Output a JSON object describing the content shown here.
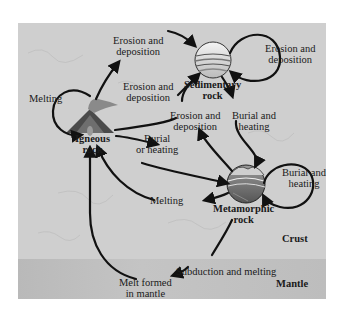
{
  "diagram": {
    "layers": {
      "crust": "Crust",
      "mantle": "Mantle"
    },
    "nodes": {
      "igneous": {
        "line1": "Igneous",
        "line2": "rock"
      },
      "sedimentary": {
        "line1": "Sedimentary",
        "line2": "rock"
      },
      "metamorphic": {
        "line1": "Metamorphic",
        "line2": "rock"
      },
      "mantle_melt": {
        "line1": "Melt formed",
        "line2": "in mantle"
      }
    },
    "processes": {
      "erosion_top": {
        "line1": "Erosion and",
        "line2": "deposition"
      },
      "erosion_sed_loop": {
        "line1": "Erosion and",
        "line2": "deposition"
      },
      "erosion_ign_to_sed": {
        "line1": "Erosion and",
        "line2": "deposition"
      },
      "erosion_met_to_sed": {
        "line1": "Erosion and",
        "line2": "deposition"
      },
      "melting_ign_loop": "Melting",
      "burial_ign_to_met": {
        "line1": "Burial",
        "line2": "or heating"
      },
      "burial_sed_to_met": {
        "line1": "Burial and",
        "line2": "heating"
      },
      "burial_met_loop": {
        "line1": "Burial and",
        "line2": "heating"
      },
      "melting_met_to_ign": "Melting",
      "subduction": "Subduction and melting"
    },
    "colors": {
      "crust": "#cfcfcf",
      "mantle": "#bdbdbd",
      "arrow": "#111111",
      "text": "#1a1a1a"
    }
  }
}
